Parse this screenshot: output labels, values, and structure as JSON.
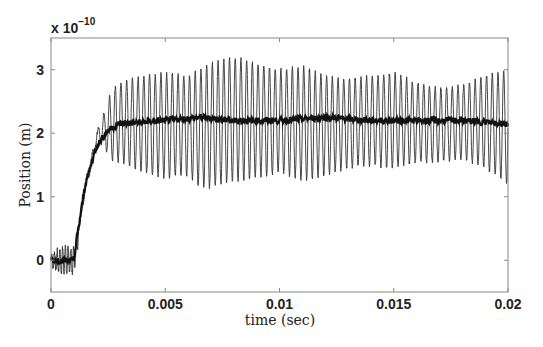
{
  "chart_data": {
    "type": "line",
    "title": "",
    "xlabel": "time (sec)",
    "ylabel": "Position (m)",
    "y_scale_annotation": "x 10^-10",
    "y_multiplier_base": "x 10",
    "y_multiplier_exponent": "−10",
    "xlim": [
      0,
      0.02
    ],
    "ylim": [
      -0.5,
      3.5
    ],
    "x_ticks": [
      0,
      0.005,
      0.01,
      0.015,
      0.02
    ],
    "x_tick_labels": [
      "0",
      "0.005",
      "0.01",
      "0.015",
      "0.02"
    ],
    "y_ticks": [
      0,
      1,
      2,
      3
    ],
    "y_tick_labels": [
      "0",
      "1",
      "2",
      "3"
    ],
    "grid": false,
    "legend": null,
    "series": [
      {
        "name": "oscillating response (thin)",
        "description": "Near 0 until ~0.001 s, rises to ~2.1 by ~0.0025 s, then oscillates around ~2.15 with amplitude ~0.8-1.0 (peaks up to ~3.2, troughs ~1.1)",
        "x": [
          0,
          0.0005,
          0.001,
          0.0015,
          0.002,
          0.0025,
          0.003,
          0.004,
          0.005,
          0.006,
          0.0065,
          0.007,
          0.008,
          0.009,
          0.01,
          0.011,
          0.012,
          0.013,
          0.014,
          0.015,
          0.016,
          0.017,
          0.018,
          0.019,
          0.02
        ],
        "upper_envelope": [
          0.1,
          0.2,
          0.2,
          1.3,
          2.1,
          2.6,
          2.8,
          2.9,
          2.95,
          2.9,
          3.0,
          3.1,
          3.2,
          3.1,
          3.0,
          3.05,
          2.9,
          2.85,
          2.9,
          2.95,
          2.8,
          2.7,
          2.75,
          2.9,
          3.0
        ],
        "lower_envelope": [
          -0.1,
          -0.2,
          -0.2,
          0.9,
          1.8,
          1.6,
          1.55,
          1.4,
          1.3,
          1.35,
          1.15,
          1.15,
          1.25,
          1.3,
          1.4,
          1.25,
          1.35,
          1.45,
          1.5,
          1.45,
          1.55,
          1.55,
          1.6,
          1.45,
          1.2
        ],
        "oscillation_period_sec": 0.00025,
        "color": "#333333"
      },
      {
        "name": "filtered mean (thick)",
        "x": [
          0,
          0.0005,
          0.001,
          0.0012,
          0.0015,
          0.002,
          0.0025,
          0.003,
          0.005,
          0.0065,
          0.008,
          0.01,
          0.012,
          0.014,
          0.016,
          0.018,
          0.02
        ],
        "values": [
          0.0,
          0.0,
          0.0,
          0.5,
          1.2,
          1.8,
          2.05,
          2.15,
          2.2,
          2.25,
          2.2,
          2.2,
          2.25,
          2.2,
          2.2,
          2.2,
          2.15
        ],
        "color": "#111111"
      }
    ]
  }
}
